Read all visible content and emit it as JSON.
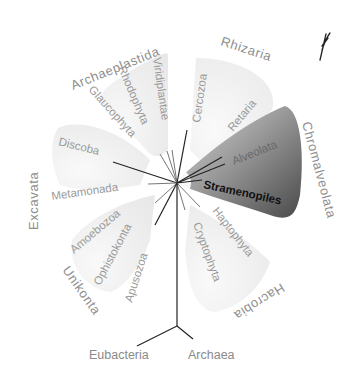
{
  "diagram": {
    "type": "unrooted eukaryotic tree of life",
    "supergroups": {
      "archaeplastida": "Archaeplastida",
      "rhizaria": "Rhizaria",
      "chromalveolata": "Chromalveolata",
      "excavata": "Excavata",
      "unikonta": "Unikonta",
      "hacrobia": "Hacrobia"
    },
    "taxa": {
      "viridiplantae": "Viridiplantae",
      "rhodophyta": "Rhodophyta",
      "glaucophyta": "Glaucophyta",
      "cercozoa": "Cercozoa",
      "retaria": "Retaria",
      "alveolata": "Alveolata",
      "stramenopiles": "Stramenopiles",
      "discoba": "Discoba",
      "metamonada": "Metamonada",
      "amoebozoa": "Amoebozoa",
      "ophistokonta": "Ophistokonta",
      "apusozoa": "Apusozoa",
      "haptophyta": "Haptophyta",
      "cryptophyta": "Cryptophyta"
    },
    "root": {
      "eubacteria": "Eubacteria",
      "archaea": "Archaea"
    },
    "colors": {
      "light_region": "#eeeeee",
      "dark_region": "#7a7a7a",
      "label_gray": "#8e8e8e",
      "branch": "#222222"
    }
  }
}
